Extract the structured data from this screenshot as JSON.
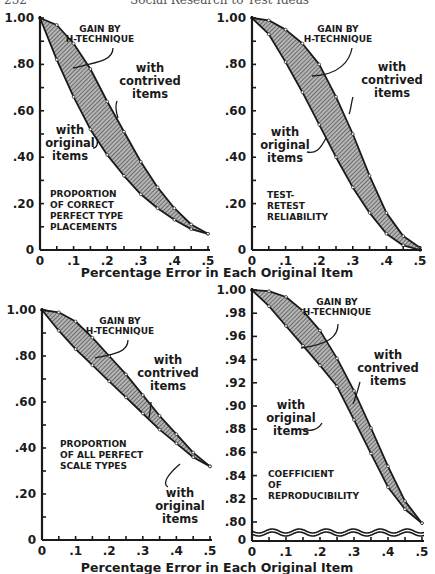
{
  "page": {
    "header_left": "252",
    "header_center": "Social Research to Test Ideas"
  },
  "shared": {
    "xlabel": "Percentage Error in Each Original Item",
    "gain_label_1": "GAIN BY",
    "gain_label_2": "H-TECHNIQUE",
    "contrived_1": "with",
    "contrived_2": "contrived",
    "contrived_3": "items",
    "original_1": "with",
    "original_2": "original",
    "original_3": "items",
    "fill_color": "#8a8a8a",
    "line_color": "#1a1a1a"
  },
  "panels": [
    {
      "id": "tl",
      "title_lines": [
        "PROPORTION",
        "OF CORRECT",
        "PERFECT TYPE",
        "PLACEMENTS"
      ]
    },
    {
      "id": "tr",
      "title_lines": [
        "TEST-",
        "RETEST",
        "RELIABILITY"
      ]
    },
    {
      "id": "bl",
      "title_lines": [
        "PROPORTION",
        "OF ALL PERFECT",
        "SCALE TYPES"
      ]
    },
    {
      "id": "br",
      "title_lines": [
        "COEFFICIENT",
        "OF",
        "REPRODUCIBILITY"
      ]
    }
  ],
  "chart_data": [
    {
      "type": "area",
      "title": "Proportion of Correct Perfect Type Placements",
      "xlabel": "Percentage Error in Each Original Item",
      "ylabel": "",
      "x": [
        0,
        0.05,
        0.1,
        0.15,
        0.2,
        0.25,
        0.3,
        0.35,
        0.4,
        0.45,
        0.5
      ],
      "xticks": [
        "0",
        ".1",
        ".2",
        ".3",
        ".4",
        ".5"
      ],
      "yticks": [
        "0",
        ".20",
        ".40",
        ".60",
        ".80",
        "1.00"
      ],
      "ylim": [
        0,
        1.0
      ],
      "series": [
        {
          "name": "with contrived items",
          "values": [
            1.0,
            0.97,
            0.89,
            0.78,
            0.64,
            0.51,
            0.38,
            0.27,
            0.18,
            0.11,
            0.07
          ]
        },
        {
          "name": "with original items",
          "values": [
            1.0,
            0.82,
            0.66,
            0.52,
            0.41,
            0.32,
            0.24,
            0.18,
            0.13,
            0.09,
            0.07
          ]
        }
      ],
      "annotations": [
        "GAIN BY H-TECHNIQUE",
        "with contrived items",
        "with original items",
        "PROPORTION OF CORRECT PERFECT TYPE PLACEMENTS"
      ],
      "grid": false
    },
    {
      "type": "area",
      "title": "Test-Retest Reliability",
      "xlabel": "Percentage Error in Each Original Item",
      "ylabel": "",
      "x": [
        0,
        0.05,
        0.1,
        0.15,
        0.2,
        0.25,
        0.3,
        0.35,
        0.4,
        0.45,
        0.5
      ],
      "xticks": [
        "0",
        ".1",
        ".2",
        ".3",
        ".4",
        ".5"
      ],
      "yticks": [
        "0",
        ".20",
        ".40",
        ".60",
        ".80",
        "1.00"
      ],
      "ylim": [
        0,
        1.0
      ],
      "series": [
        {
          "name": "with contrived items",
          "values": [
            1.0,
            0.99,
            0.95,
            0.89,
            0.8,
            0.66,
            0.5,
            0.32,
            0.16,
            0.06,
            0.01
          ]
        },
        {
          "name": "with original items",
          "values": [
            1.0,
            0.93,
            0.81,
            0.68,
            0.54,
            0.4,
            0.27,
            0.16,
            0.07,
            0.02,
            0.0
          ]
        }
      ],
      "annotations": [
        "GAIN BY H-TECHNIQUE",
        "with contrived items",
        "with original items",
        "TEST-RETEST RELIABILITY"
      ],
      "grid": false
    },
    {
      "type": "area",
      "title": "Proportion of All Perfect Scale Types",
      "xlabel": "Percentage Error in Each Original Item",
      "ylabel": "",
      "x": [
        0,
        0.05,
        0.1,
        0.15,
        0.2,
        0.25,
        0.3,
        0.35,
        0.4,
        0.45,
        0.5
      ],
      "xticks": [
        "0",
        ".1",
        ".2",
        ".3",
        ".4",
        ".5"
      ],
      "yticks": [
        "0",
        ".20",
        ".40",
        ".60",
        ".80",
        "1.00"
      ],
      "ylim": [
        0,
        1.0
      ],
      "series": [
        {
          "name": "with contrived items",
          "values": [
            1.0,
            0.99,
            0.95,
            0.88,
            0.8,
            0.72,
            0.63,
            0.54,
            0.46,
            0.38,
            0.32
          ]
        },
        {
          "name": "with original items",
          "values": [
            1.0,
            0.91,
            0.83,
            0.76,
            0.69,
            0.62,
            0.55,
            0.48,
            0.42,
            0.36,
            0.32
          ]
        }
      ],
      "annotations": [
        "GAIN BY H-TECHNIQUE",
        "with contrived items",
        "with original items",
        "PROPORTION OF ALL PERFECT SCALE TYPES"
      ],
      "grid": false
    },
    {
      "type": "area",
      "title": "Coefficient of Reproducibility",
      "xlabel": "Percentage Error in Each Original Item",
      "ylabel": "",
      "x": [
        0,
        0.05,
        0.1,
        0.15,
        0.2,
        0.25,
        0.3,
        0.35,
        0.4,
        0.45,
        0.5
      ],
      "xticks": [
        "0",
        ".1",
        ".2",
        ".3",
        ".4",
        ".5"
      ],
      "yticks": [
        "0",
        ".80",
        ".82",
        ".84",
        ".86",
        ".88",
        ".90",
        ".92",
        ".94",
        ".96",
        ".98",
        "1.00"
      ],
      "ylim": [
        0.8,
        1.0
      ],
      "axis_break": "broken axis between 0 and .80",
      "series": [
        {
          "name": "with contrived items",
          "values": [
            1.0,
            0.999,
            0.994,
            0.982,
            0.965,
            0.941,
            0.913,
            0.881,
            0.848,
            0.818,
            0.799
          ]
        },
        {
          "name": "with original items",
          "values": [
            1.0,
            0.986,
            0.969,
            0.952,
            0.935,
            0.917,
            0.888,
            0.859,
            0.83,
            0.811,
            0.799
          ]
        }
      ],
      "annotations": [
        "GAIN BY H-TECHNIQUE",
        "with contrived items",
        "with original items",
        "COEFFICIENT OF REPRODUCIBILITY"
      ],
      "grid": false
    }
  ]
}
